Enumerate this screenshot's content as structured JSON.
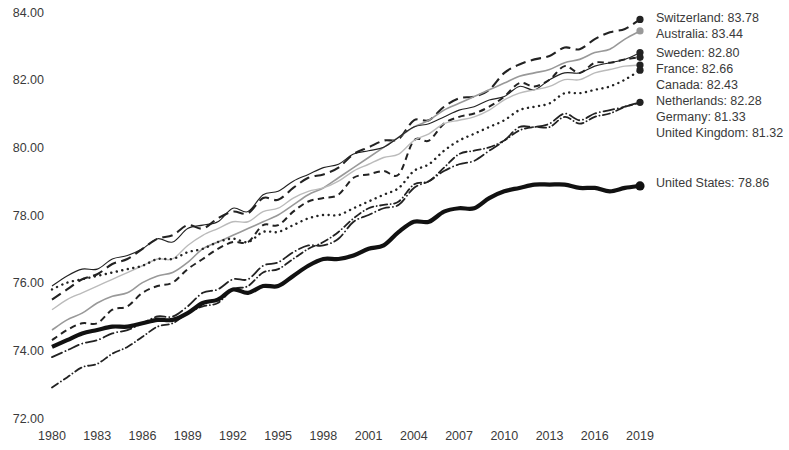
{
  "chart_data": {
    "type": "line",
    "title": "",
    "subtitle": "",
    "xlabel": "",
    "ylabel": "",
    "xlim": [
      1980,
      2019
    ],
    "ylim": [
      72.0,
      84.0
    ],
    "grid": false,
    "legend_position": "right",
    "y_ticks": [
      "84.00",
      "82.00",
      "80.00",
      "78.00",
      "76.00",
      "74.00",
      "72.00"
    ],
    "y_tick_values": [
      84,
      82,
      80,
      78,
      76,
      74,
      72
    ],
    "x_ticks": [
      "1980",
      "1983",
      "1986",
      "1989",
      "1992",
      "1995",
      "1998",
      "2001",
      "2004",
      "2007",
      "2010",
      "2013",
      "2016",
      "2019"
    ],
    "x_tick_values": [
      1980,
      1983,
      1986,
      1989,
      1992,
      1995,
      1998,
      2001,
      2004,
      2007,
      2010,
      2013,
      2016,
      2019
    ],
    "x": [
      1980,
      1981,
      1982,
      1983,
      1984,
      1985,
      1986,
      1987,
      1988,
      1989,
      1990,
      1991,
      1992,
      1993,
      1994,
      1995,
      1996,
      1997,
      1998,
      1999,
      2000,
      2001,
      2002,
      2003,
      2004,
      2005,
      2006,
      2007,
      2008,
      2009,
      2010,
      2011,
      2012,
      2013,
      2014,
      2015,
      2016,
      2017,
      2018,
      2019
    ],
    "series": [
      {
        "name": "Switzerland",
        "end_value": 83.78,
        "color": "#222222",
        "style": "dashed",
        "width": 2.1,
        "marker": "circle",
        "values": [
          75.5,
          75.8,
          76.1,
          76.25,
          76.55,
          76.7,
          77.0,
          77.3,
          77.4,
          77.7,
          77.6,
          77.9,
          78.1,
          78.05,
          78.5,
          78.45,
          78.8,
          79.1,
          79.2,
          79.4,
          79.8,
          80.0,
          80.2,
          80.25,
          80.8,
          80.8,
          81.2,
          81.45,
          81.5,
          81.7,
          82.2,
          82.45,
          82.6,
          82.7,
          82.95,
          82.9,
          83.2,
          83.4,
          83.5,
          83.78
        ]
      },
      {
        "name": "Australia",
        "end_value": 83.44,
        "color": "#999999",
        "style": "solid",
        "width": 1.6,
        "marker": "circle",
        "values": [
          74.6,
          74.9,
          75.1,
          75.4,
          75.6,
          75.7,
          76.0,
          76.2,
          76.3,
          76.6,
          77.0,
          77.2,
          77.4,
          77.6,
          77.8,
          78.0,
          78.3,
          78.6,
          78.8,
          79.1,
          79.4,
          79.7,
          80.0,
          80.3,
          80.6,
          80.8,
          81.1,
          81.3,
          81.5,
          81.7,
          81.9,
          82.1,
          82.2,
          82.3,
          82.5,
          82.6,
          82.8,
          82.9,
          83.2,
          83.44
        ]
      },
      {
        "name": "Sweden",
        "end_value": 82.8,
        "color": "#222222",
        "style": "solid",
        "width": 1.1,
        "marker": "circle",
        "values": [
          75.9,
          76.2,
          76.4,
          76.4,
          76.7,
          76.8,
          77.0,
          77.3,
          77.2,
          77.6,
          77.7,
          77.8,
          78.2,
          78.1,
          78.6,
          78.7,
          79.0,
          79.2,
          79.4,
          79.5,
          79.8,
          79.9,
          80.0,
          80.3,
          80.6,
          80.7,
          80.9,
          81.1,
          81.2,
          81.4,
          81.5,
          81.8,
          81.7,
          82.0,
          82.2,
          82.2,
          82.4,
          82.5,
          82.6,
          82.8
        ]
      },
      {
        "name": "France",
        "end_value": 82.66,
        "color": "#222222",
        "style": "dashed-short",
        "width": 2.0,
        "marker": "circle",
        "values": [
          74.3,
          74.6,
          74.8,
          74.8,
          75.2,
          75.3,
          75.7,
          75.9,
          76.0,
          76.4,
          76.7,
          77.0,
          77.2,
          77.2,
          77.7,
          77.7,
          78.1,
          78.4,
          78.5,
          78.6,
          79.1,
          79.2,
          79.3,
          79.2,
          80.2,
          80.2,
          80.7,
          80.9,
          81.0,
          81.2,
          81.5,
          81.9,
          81.8,
          82.0,
          82.4,
          82.2,
          82.5,
          82.5,
          82.6,
          82.66
        ]
      },
      {
        "name": "Canada",
        "end_value": 82.43,
        "color": "#bbbbbb",
        "style": "solid",
        "width": 1.4,
        "marker": "circle",
        "values": [
          75.2,
          75.5,
          75.7,
          75.9,
          76.1,
          76.3,
          76.5,
          76.7,
          76.7,
          77.1,
          77.4,
          77.6,
          77.8,
          77.8,
          78.1,
          78.2,
          78.5,
          78.7,
          78.8,
          79.0,
          79.3,
          79.5,
          79.7,
          79.8,
          80.2,
          80.4,
          80.7,
          80.8,
          80.9,
          81.1,
          81.4,
          81.6,
          81.7,
          81.8,
          82.0,
          82.0,
          82.2,
          82.3,
          82.4,
          82.43
        ]
      },
      {
        "name": "Netherlands",
        "end_value": 82.28,
        "color": "#222222",
        "style": "dotted",
        "width": 2.4,
        "marker": "circle",
        "values": [
          75.8,
          76.0,
          76.1,
          76.2,
          76.3,
          76.4,
          76.5,
          76.7,
          76.7,
          76.9,
          77.0,
          77.2,
          77.3,
          77.2,
          77.5,
          77.5,
          77.7,
          77.9,
          78.0,
          78.0,
          78.2,
          78.4,
          78.6,
          78.8,
          79.3,
          79.5,
          79.9,
          80.2,
          80.4,
          80.6,
          80.8,
          81.1,
          81.2,
          81.3,
          81.6,
          81.6,
          81.7,
          81.8,
          82.0,
          82.28
        ]
      },
      {
        "name": "Germany",
        "end_value": 81.33,
        "color": "#222222",
        "style": "dash-dot",
        "width": 1.8,
        "marker": "circle",
        "values": [
          72.9,
          73.2,
          73.5,
          73.6,
          73.9,
          74.1,
          74.4,
          74.7,
          74.8,
          75.1,
          75.3,
          75.4,
          75.8,
          75.9,
          76.3,
          76.4,
          76.7,
          77.0,
          77.2,
          77.5,
          77.9,
          78.2,
          78.3,
          78.4,
          78.9,
          79.0,
          79.4,
          79.8,
          79.9,
          80.0,
          80.2,
          80.5,
          80.6,
          80.6,
          80.9,
          80.7,
          80.9,
          81.0,
          81.2,
          81.33
        ]
      },
      {
        "name": "United Kingdom",
        "end_value": 81.32,
        "color": "#222222",
        "style": "dash-dot-long",
        "width": 1.8,
        "marker": "none",
        "values": [
          73.8,
          74.0,
          74.2,
          74.3,
          74.5,
          74.6,
          74.8,
          75.0,
          75.0,
          75.3,
          75.7,
          75.8,
          76.1,
          76.1,
          76.5,
          76.6,
          76.9,
          77.1,
          77.1,
          77.3,
          77.8,
          78.0,
          78.2,
          78.3,
          78.8,
          79.0,
          79.3,
          79.5,
          79.6,
          79.9,
          80.2,
          80.6,
          80.6,
          80.7,
          81.0,
          80.8,
          81.0,
          81.1,
          81.2,
          81.32
        ]
      },
      {
        "name": "United States",
        "end_value": 78.86,
        "color": "#111111",
        "style": "solid",
        "width": 4.2,
        "marker": "circle",
        "values": [
          74.1,
          74.3,
          74.5,
          74.6,
          74.7,
          74.7,
          74.8,
          74.9,
          74.9,
          75.1,
          75.4,
          75.5,
          75.8,
          75.7,
          75.9,
          75.9,
          76.2,
          76.5,
          76.7,
          76.7,
          76.8,
          77.0,
          77.1,
          77.5,
          77.8,
          77.8,
          78.1,
          78.2,
          78.2,
          78.5,
          78.7,
          78.8,
          78.9,
          78.9,
          78.9,
          78.8,
          78.8,
          78.7,
          78.8,
          78.86
        ]
      }
    ],
    "legend_entries": [
      {
        "name": "Switzerland",
        "value": "83.78",
        "label": "Switzerland:  83.78"
      },
      {
        "name": "Australia",
        "value": "83.44",
        "label": "Australia:  83.44"
      },
      {
        "name": "Sweden",
        "value": "82.80",
        "label": "Sweden:  82.80"
      },
      {
        "name": "France",
        "value": "82.66",
        "label": "France:  82.66"
      },
      {
        "name": "Canada",
        "value": "82.43",
        "label": "Canada:  82.43"
      },
      {
        "name": "Netherlands",
        "value": "82.28",
        "label": "Netherlands:  82.28"
      },
      {
        "name": "Germany",
        "value": "81.33",
        "label": "Germany:  81.33"
      },
      {
        "name": "United Kingdom",
        "value": "81.32",
        "label": "United Kingdom:  81.32"
      },
      {
        "name": "United States",
        "value": "78.86",
        "label": "United States:  78.86"
      }
    ]
  },
  "layout": {
    "plot_left": 52,
    "plot_right": 640,
    "plot_top": 12,
    "plot_bottom": 418,
    "legend_x": 656,
    "legend_label_offsets": [
      17,
      33,
      52,
      68,
      84,
      100,
      116,
      132
    ],
    "us_legend_y": 187
  }
}
